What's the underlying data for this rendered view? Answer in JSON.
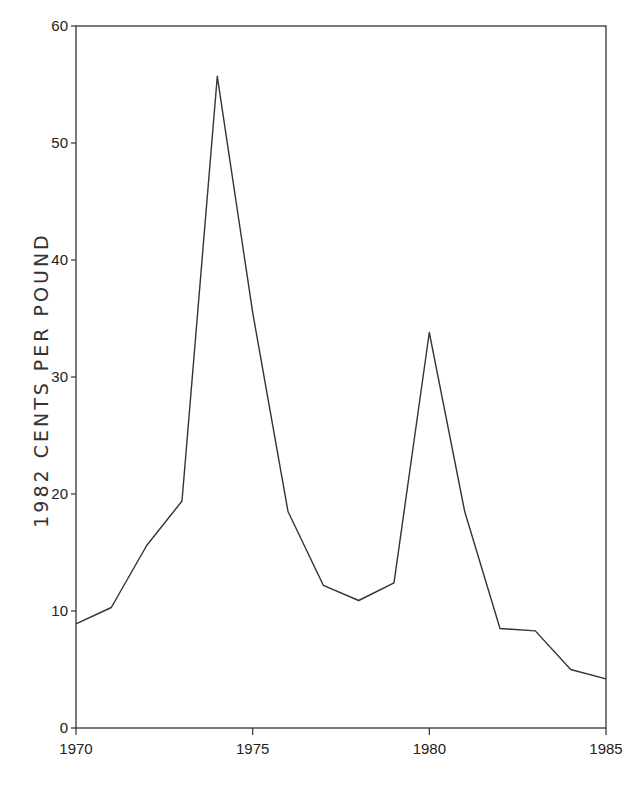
{
  "chart_data": {
    "type": "line",
    "title": "",
    "xlabel": "",
    "ylabel": "1982 CENTS PER POUND",
    "xlim": [
      1970,
      1985
    ],
    "ylim": [
      0,
      60
    ],
    "x_ticks": [
      1970,
      1975,
      1980,
      1985
    ],
    "y_ticks": [
      0,
      10,
      20,
      30,
      40,
      50,
      60
    ],
    "grid": false,
    "legend": null,
    "x": [
      1970,
      1971,
      1972,
      1973,
      1974,
      1975,
      1976,
      1977,
      1978,
      1979,
      1980,
      1981,
      1982,
      1983,
      1984,
      1985
    ],
    "series": [
      {
        "name": "Price (1982 cents per pound)",
        "color": "#333333",
        "values": [
          8.9,
          10.3,
          15.6,
          19.4,
          55.7,
          35.5,
          18.5,
          12.2,
          10.9,
          12.4,
          33.8,
          18.5,
          8.5,
          8.3,
          5.0,
          4.2
        ]
      }
    ]
  },
  "axis": {
    "ylabel": "1982 CENTS PER POUND"
  }
}
